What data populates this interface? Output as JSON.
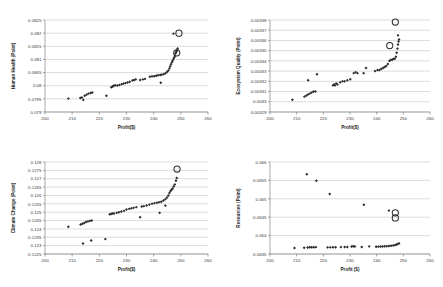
{
  "figure": {
    "panel_count": 4,
    "background_color": "#ffffff",
    "marker_color": "#2b2b2b",
    "gridline_color": "#b9b9b9",
    "axis_color": "#6f6f6f"
  },
  "chart_data": [
    {
      "id": "human-health",
      "type": "scatter",
      "title": "",
      "xlabel": "Profit($)",
      "ylabel": "Human Health (Point)",
      "xlim": [
        200,
        260
      ],
      "ylim": [
        0.079,
        0.0825
      ],
      "xticks": [
        200,
        210,
        220,
        230,
        240,
        250,
        260
      ],
      "yticks": [
        0.079,
        0.0795,
        0.08,
        0.0805,
        0.081,
        0.0815,
        0.082,
        0.0825
      ],
      "ytick_labels": [
        "0.079",
        "0.0795",
        "0.08",
        "0.0805",
        "0.081",
        "0.0815",
        "0.082",
        "0.0825"
      ],
      "grid": "horizontal",
      "legend": "none",
      "points": [
        [
          208.6,
          0.07951
        ],
        [
          213.0,
          0.07953
        ],
        [
          213.6,
          0.07955
        ],
        [
          214.1,
          0.07946
        ],
        [
          214.6,
          0.07962
        ],
        [
          215.3,
          0.07966
        ],
        [
          216.0,
          0.0797
        ],
        [
          216.8,
          0.07972
        ],
        [
          217.4,
          0.07974
        ],
        [
          222.6,
          0.07962
        ],
        [
          224.4,
          0.07994
        ],
        [
          224.9,
          0.07997
        ],
        [
          225.3,
          0.08
        ],
        [
          225.8,
          0.08002
        ],
        [
          226.6,
          0.08001
        ],
        [
          227.4,
          0.08003
        ],
        [
          228.2,
          0.08006
        ],
        [
          228.9,
          0.08008
        ],
        [
          229.6,
          0.0801
        ],
        [
          230.4,
          0.08012
        ],
        [
          231.2,
          0.08015
        ],
        [
          232.2,
          0.0802
        ],
        [
          232.8,
          0.08022
        ],
        [
          233.4,
          0.08024
        ],
        [
          235.0,
          0.08022
        ],
        [
          236.0,
          0.08024
        ],
        [
          236.8,
          0.08026
        ],
        [
          238.6,
          0.08034
        ],
        [
          239.4,
          0.08036
        ],
        [
          240.2,
          0.08036
        ],
        [
          240.9,
          0.08038
        ],
        [
          241.6,
          0.0804
        ],
        [
          242.4,
          0.08041
        ],
        [
          243.0,
          0.08042
        ],
        [
          243.7,
          0.08044
        ],
        [
          244.3,
          0.08047
        ],
        [
          244.9,
          0.08052
        ],
        [
          245.4,
          0.08058
        ],
        [
          245.8,
          0.08066
        ],
        [
          246.1,
          0.08074
        ],
        [
          246.4,
          0.08082
        ],
        [
          246.7,
          0.08089
        ],
        [
          247.0,
          0.08095
        ],
        [
          247.3,
          0.08102
        ],
        [
          247.6,
          0.08108
        ],
        [
          247.8,
          0.08113
        ],
        [
          248.0,
          0.08122
        ],
        [
          248.2,
          0.08126
        ],
        [
          248.4,
          0.08131
        ],
        [
          248.6,
          0.08135
        ],
        [
          248.8,
          0.08142
        ],
        [
          242.6,
          0.08011
        ],
        [
          247.3,
          0.08198
        ]
      ],
      "highlighted_points": [
        [
          249.3,
          0.082
        ],
        [
          248.5,
          0.08125
        ]
      ]
    },
    {
      "id": "ecosystem-quality",
      "type": "scatter",
      "title": "",
      "xlabel": "Profit($)",
      "ylabel": "Ecosystem Quality (Point)",
      "xlim": [
        200,
        260
      ],
      "ylim": [
        0.00329,
        0.00338
      ],
      "xticks": [
        200,
        210,
        220,
        230,
        240,
        250,
        260
      ],
      "yticks": [
        0.00329,
        0.0033,
        0.00331,
        0.00332,
        0.00333,
        0.00334,
        0.00335,
        0.00336,
        0.00337,
        0.00338
      ],
      "ytick_labels": [
        "0.00329",
        "0.0033",
        "0.00331",
        "0.00332",
        "0.00333",
        "0.00334",
        "0.00335",
        "0.00336",
        "0.00337",
        "0.00338"
      ],
      "grid": "horizontal",
      "legend": "none",
      "points": [
        [
          208.4,
          0.003302
        ],
        [
          212.9,
          0.003305
        ],
        [
          213.6,
          0.003306
        ],
        [
          214.2,
          0.003307
        ],
        [
          214.9,
          0.003308
        ],
        [
          215.6,
          0.003309
        ],
        [
          216.3,
          0.00331
        ],
        [
          217.0,
          0.00331
        ],
        [
          214.3,
          0.003321
        ],
        [
          217.6,
          0.003327
        ],
        [
          223.6,
          0.003316
        ],
        [
          224.0,
          0.003317
        ],
        [
          224.4,
          0.003316
        ],
        [
          224.8,
          0.003318
        ],
        [
          225.3,
          0.003317
        ],
        [
          226.3,
          0.003319
        ],
        [
          227.2,
          0.00332
        ],
        [
          228.0,
          0.00332
        ],
        [
          229.0,
          0.003321
        ],
        [
          230.1,
          0.003322
        ],
        [
          231.4,
          0.003328
        ],
        [
          232.1,
          0.003329
        ],
        [
          232.8,
          0.003328
        ],
        [
          235.1,
          0.003328
        ],
        [
          236.0,
          0.003333
        ],
        [
          239.4,
          0.00333
        ],
        [
          240.3,
          0.003331
        ],
        [
          241.0,
          0.003331
        ],
        [
          241.7,
          0.003332
        ],
        [
          242.4,
          0.003333
        ],
        [
          243.0,
          0.003334
        ],
        [
          243.6,
          0.003335
        ],
        [
          244.2,
          0.003337
        ],
        [
          244.8,
          0.00334
        ],
        [
          245.3,
          0.003341
        ],
        [
          245.8,
          0.003341
        ],
        [
          246.3,
          0.003342
        ],
        [
          246.8,
          0.003342
        ],
        [
          247.2,
          0.003344
        ],
        [
          247.5,
          0.003348
        ],
        [
          247.8,
          0.003352
        ],
        [
          248.0,
          0.003356
        ],
        [
          248.2,
          0.003359
        ],
        [
          248.4,
          0.003361
        ],
        [
          248.0,
          0.003365
        ]
      ],
      "highlighted_points": [
        [
          247.0,
          0.003378
        ],
        [
          244.9,
          0.003355
        ]
      ]
    },
    {
      "id": "climate-change",
      "type": "scatter",
      "title": "",
      "xlabel": "Profit($)",
      "ylabel": "Climate Change (Point)",
      "xlim": [
        200,
        260
      ],
      "ylim": [
        0.1225,
        0.128
      ],
      "xticks": [
        200,
        210,
        220,
        230,
        240,
        250,
        260
      ],
      "yticks": [
        0.1225,
        0.123,
        0.1235,
        0.124,
        0.1245,
        0.125,
        0.1255,
        0.126,
        0.1265,
        0.127,
        0.1275,
        0.128
      ],
      "ytick_labels": [
        "0.1225",
        "0.123",
        "0.1235",
        "0.124",
        "0.1245",
        "0.125",
        "0.1255",
        "0.126",
        "0.1265",
        "0.127",
        "0.1275",
        "0.128"
      ],
      "grid": "horizontal",
      "legend": "none",
      "points": [
        [
          208.6,
          0.12413
        ],
        [
          213.1,
          0.12426
        ],
        [
          213.8,
          0.12431
        ],
        [
          214.4,
          0.12435
        ],
        [
          215.1,
          0.12441
        ],
        [
          215.8,
          0.12445
        ],
        [
          216.5,
          0.12448
        ],
        [
          217.2,
          0.1245
        ],
        [
          214.0,
          0.12313
        ],
        [
          217.0,
          0.12331
        ],
        [
          222.2,
          0.12339
        ],
        [
          223.8,
          0.12487
        ],
        [
          224.3,
          0.12489
        ],
        [
          224.8,
          0.12492
        ],
        [
          225.4,
          0.12492
        ],
        [
          226.4,
          0.12496
        ],
        [
          227.2,
          0.125
        ],
        [
          228.1,
          0.12504
        ],
        [
          229.1,
          0.12508
        ],
        [
          230.0,
          0.12516
        ],
        [
          231.0,
          0.1252
        ],
        [
          231.8,
          0.12523
        ],
        [
          232.6,
          0.12526
        ],
        [
          233.6,
          0.1253
        ],
        [
          235.6,
          0.12534
        ],
        [
          236.4,
          0.12536
        ],
        [
          237.4,
          0.1254
        ],
        [
          238.4,
          0.12545
        ],
        [
          239.4,
          0.1255
        ],
        [
          240.3,
          0.12554
        ],
        [
          241.2,
          0.12556
        ],
        [
          242.0,
          0.1256
        ],
        [
          242.8,
          0.12562
        ],
        [
          243.6,
          0.1257
        ],
        [
          244.3,
          0.12578
        ],
        [
          244.9,
          0.12588
        ],
        [
          245.4,
          0.126
        ],
        [
          245.8,
          0.12615
        ],
        [
          246.2,
          0.12626
        ],
        [
          246.6,
          0.12634
        ],
        [
          247.0,
          0.12642
        ],
        [
          247.4,
          0.12655
        ],
        [
          247.8,
          0.12666
        ],
        [
          248.2,
          0.12688
        ],
        [
          248.5,
          0.12704
        ],
        [
          235.0,
          0.1247
        ],
        [
          242.2,
          0.12496
        ],
        [
          244.3,
          0.12539
        ]
      ],
      "highlighted_points": [
        [
          248.6,
          0.12758
        ]
      ]
    },
    {
      "id": "resources",
      "type": "scatter",
      "title": "",
      "xlabel": "Profit ($)",
      "ylabel": "Resources (Point)",
      "xlim": [
        200,
        260
      ],
      "ylim": [
        0.0635,
        0.066
      ],
      "xticks": [
        200,
        210,
        220,
        230,
        240,
        250,
        260
      ],
      "yticks": [
        0.0635,
        0.064,
        0.0645,
        0.065,
        0.0655,
        0.066
      ],
      "ytick_labels": [
        "0.0635",
        "0.064",
        "0.0645",
        "0.065",
        "0.0655",
        "0.066"
      ],
      "grid": "horizontal",
      "legend": "none",
      "points": [
        [
          209.2,
          0.063663
        ],
        [
          212.8,
          0.063668
        ],
        [
          214.1,
          0.063678
        ],
        [
          214.9,
          0.063683
        ],
        [
          215.6,
          0.063684
        ],
        [
          216.4,
          0.063685
        ],
        [
          217.2,
          0.063686
        ],
        [
          221.6,
          0.06368
        ],
        [
          222.6,
          0.063681
        ],
        [
          223.6,
          0.063682
        ],
        [
          224.6,
          0.063684
        ],
        [
          226.6,
          0.063688
        ],
        [
          228.0,
          0.06369
        ],
        [
          229.0,
          0.063692
        ],
        [
          230.6,
          0.063702
        ],
        [
          231.2,
          0.06371
        ],
        [
          231.8,
          0.063705
        ],
        [
          234.4,
          0.063692
        ],
        [
          237.2,
          0.063706
        ],
        [
          239.8,
          0.063698
        ],
        [
          240.6,
          0.0637
        ],
        [
          241.4,
          0.063702
        ],
        [
          242.2,
          0.063704
        ],
        [
          243.0,
          0.06371
        ],
        [
          243.8,
          0.063712
        ],
        [
          244.6,
          0.063718
        ],
        [
          245.4,
          0.063724
        ],
        [
          246.2,
          0.063733
        ],
        [
          246.9,
          0.063745
        ],
        [
          247.5,
          0.06376
        ],
        [
          248.0,
          0.063776
        ],
        [
          248.4,
          0.06379
        ],
        [
          213.8,
          0.065668
        ],
        [
          217.4,
          0.065492
        ],
        [
          222.4,
          0.06513
        ],
        [
          235.2,
          0.06484
        ],
        [
          244.6,
          0.06468
        ]
      ],
      "highlighted_points": [
        [
          247.0,
          0.06462
        ],
        [
          247.0,
          0.06448
        ]
      ]
    }
  ]
}
